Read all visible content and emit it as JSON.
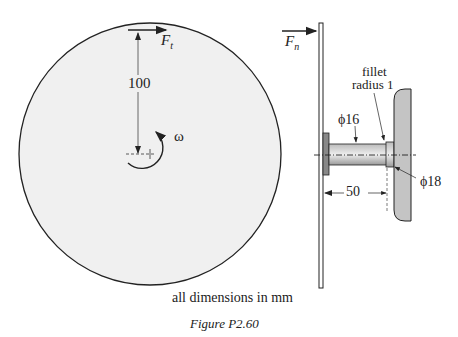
{
  "figure": {
    "caption": "Figure P2.60",
    "note": "all dimensions in mm"
  },
  "labels": {
    "force_tangential": "F",
    "force_tangential_sub": "t",
    "force_normal": "F",
    "force_normal_sub": "n",
    "radius_dim": "100",
    "omega": "ω",
    "fillet_line1": "fillet",
    "fillet_line2": "radius  1",
    "dia_shaft": "ϕ16",
    "dia_shoulder": "ϕ18",
    "length_dim": "50"
  },
  "colors": {
    "disk_fill": "#f0f0f0",
    "wall_fill": "#c4c4c4",
    "shaft_fill": "#d8d8d8",
    "hub_fill": "#888888",
    "stroke": "#222222"
  }
}
